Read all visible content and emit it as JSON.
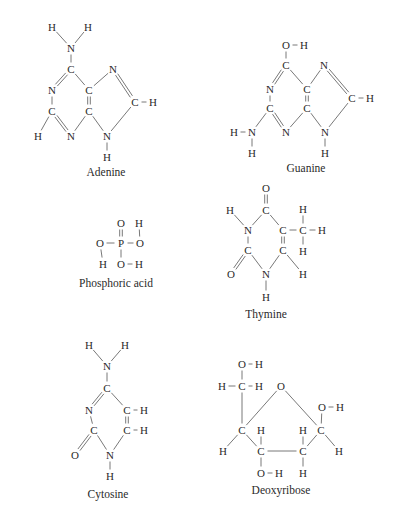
{
  "figure": {
    "type": "chemical-structures",
    "molecules": [
      {
        "id": "adenine",
        "name": "Adenine",
        "atoms": [
          {
            "t": "H",
            "x": 52,
            "y": 27
          },
          {
            "t": "H",
            "x": 88,
            "y": 27
          },
          {
            "t": "N",
            "x": 71,
            "y": 48
          },
          {
            "t": "C",
            "x": 71,
            "y": 69
          },
          {
            "t": "N",
            "x": 113,
            "y": 69
          },
          {
            "t": "N",
            "x": 52,
            "y": 90
          },
          {
            "t": "C",
            "x": 89,
            "y": 90
          },
          {
            "t": "C",
            "x": 52,
            "y": 111
          },
          {
            "t": "C",
            "x": 89,
            "y": 111
          },
          {
            "t": "C",
            "x": 135,
            "y": 102
          },
          {
            "t": "H",
            "x": 153,
            "y": 102
          },
          {
            "t": "H",
            "x": 38,
            "y": 136
          },
          {
            "t": "N",
            "x": 71,
            "y": 136
          },
          {
            "t": "N",
            "x": 107,
            "y": 136
          },
          {
            "t": "H",
            "x": 107,
            "y": 157
          }
        ],
        "bonds": [
          [
            0,
            2,
            1
          ],
          [
            1,
            2,
            1
          ],
          [
            2,
            3,
            1
          ],
          [
            3,
            5,
            2
          ],
          [
            3,
            6,
            1
          ],
          [
            6,
            4,
            1
          ],
          [
            4,
            9,
            2
          ],
          [
            9,
            10,
            1
          ],
          [
            5,
            7,
            1
          ],
          [
            7,
            11,
            1
          ],
          [
            7,
            12,
            2
          ],
          [
            12,
            8,
            1
          ],
          [
            6,
            8,
            2
          ],
          [
            8,
            13,
            1
          ],
          [
            13,
            9,
            1
          ],
          [
            13,
            14,
            1
          ]
        ],
        "label_pos": {
          "x": 106,
          "y": 172
        }
      },
      {
        "id": "guanine",
        "name": "Guanine",
        "atoms": [
          {
            "t": "O",
            "x": 286,
            "y": 45
          },
          {
            "t": "H",
            "x": 304,
            "y": 45
          },
          {
            "t": "C",
            "x": 286,
            "y": 65
          },
          {
            "t": "N",
            "x": 324,
            "y": 65
          },
          {
            "t": "N",
            "x": 270,
            "y": 89
          },
          {
            "t": "C",
            "x": 307,
            "y": 89
          },
          {
            "t": "C",
            "x": 270,
            "y": 108
          },
          {
            "t": "C",
            "x": 307,
            "y": 108
          },
          {
            "t": "C",
            "x": 352,
            "y": 98
          },
          {
            "t": "H",
            "x": 370,
            "y": 98
          },
          {
            "t": "H",
            "x": 234,
            "y": 132
          },
          {
            "t": "N",
            "x": 252,
            "y": 132
          },
          {
            "t": "N",
            "x": 286,
            "y": 132
          },
          {
            "t": "N",
            "x": 325,
            "y": 132
          },
          {
            "t": "H",
            "x": 252,
            "y": 153
          },
          {
            "t": "H",
            "x": 325,
            "y": 153
          }
        ],
        "bonds": [
          [
            0,
            1,
            1
          ],
          [
            0,
            2,
            1
          ],
          [
            2,
            4,
            2
          ],
          [
            2,
            5,
            1
          ],
          [
            5,
            3,
            1
          ],
          [
            3,
            8,
            2
          ],
          [
            8,
            9,
            1
          ],
          [
            4,
            6,
            1
          ],
          [
            6,
            11,
            1
          ],
          [
            10,
            11,
            1
          ],
          [
            11,
            14,
            1
          ],
          [
            6,
            12,
            2
          ],
          [
            12,
            7,
            1
          ],
          [
            5,
            7,
            2
          ],
          [
            7,
            13,
            1
          ],
          [
            13,
            8,
            1
          ],
          [
            13,
            15,
            1
          ]
        ],
        "label_pos": {
          "x": 306,
          "y": 168
        }
      },
      {
        "id": "phosphoric-acid",
        "name": "Phosphoric acid",
        "atoms": [
          {
            "t": "O",
            "x": 121,
            "y": 223
          },
          {
            "t": "H",
            "x": 139,
            "y": 223
          },
          {
            "t": "O",
            "x": 100,
            "y": 243
          },
          {
            "t": "P",
            "x": 121,
            "y": 243
          },
          {
            "t": "O",
            "x": 140,
            "y": 243
          },
          {
            "t": "H",
            "x": 103,
            "y": 264
          },
          {
            "t": "O",
            "x": 121,
            "y": 264
          },
          {
            "t": "H",
            "x": 139,
            "y": 264
          }
        ],
        "bonds": [
          [
            0,
            3,
            2
          ],
          [
            2,
            3,
            1
          ],
          [
            3,
            4,
            1
          ],
          [
            1,
            4,
            1
          ],
          [
            2,
            5,
            1
          ],
          [
            3,
            6,
            1
          ],
          [
            6,
            7,
            1
          ]
        ],
        "label_pos": {
          "x": 116,
          "y": 283
        }
      },
      {
        "id": "thymine",
        "name": "Thymine",
        "atoms": [
          {
            "t": "O",
            "x": 266,
            "y": 188
          },
          {
            "t": "H",
            "x": 230,
            "y": 210
          },
          {
            "t": "C",
            "x": 266,
            "y": 210
          },
          {
            "t": "H",
            "x": 303,
            "y": 209
          },
          {
            "t": "N",
            "x": 248,
            "y": 230
          },
          {
            "t": "C",
            "x": 283,
            "y": 230
          },
          {
            "t": "C",
            "x": 303,
            "y": 230
          },
          {
            "t": "H",
            "x": 322,
            "y": 230
          },
          {
            "t": "C",
            "x": 248,
            "y": 250
          },
          {
            "t": "C",
            "x": 283,
            "y": 250
          },
          {
            "t": "H",
            "x": 303,
            "y": 251
          },
          {
            "t": "O",
            "x": 231,
            "y": 274
          },
          {
            "t": "N",
            "x": 266,
            "y": 274
          },
          {
            "t": "H",
            "x": 303,
            "y": 274
          },
          {
            "t": "H",
            "x": 266,
            "y": 297
          }
        ],
        "bonds": [
          [
            0,
            2,
            2
          ],
          [
            1,
            4,
            1
          ],
          [
            2,
            4,
            1
          ],
          [
            2,
            5,
            1
          ],
          [
            5,
            6,
            1
          ],
          [
            6,
            3,
            1
          ],
          [
            6,
            7,
            1
          ],
          [
            6,
            10,
            1
          ],
          [
            4,
            8,
            1
          ],
          [
            8,
            11,
            2
          ],
          [
            8,
            12,
            1
          ],
          [
            5,
            9,
            2
          ],
          [
            9,
            12,
            1
          ],
          [
            9,
            13,
            1
          ],
          [
            12,
            14,
            1
          ]
        ],
        "label_pos": {
          "x": 266,
          "y": 314
        }
      },
      {
        "id": "cytosine",
        "name": "Cytosine",
        "atoms": [
          {
            "t": "H",
            "x": 89,
            "y": 345
          },
          {
            "t": "H",
            "x": 125,
            "y": 345
          },
          {
            "t": "N",
            "x": 107,
            "y": 366
          },
          {
            "t": "C",
            "x": 107,
            "y": 388
          },
          {
            "t": "N",
            "x": 89,
            "y": 410
          },
          {
            "t": "C",
            "x": 127,
            "y": 410
          },
          {
            "t": "H",
            "x": 144,
            "y": 410
          },
          {
            "t": "C",
            "x": 94,
            "y": 430
          },
          {
            "t": "C",
            "x": 127,
            "y": 430
          },
          {
            "t": "H",
            "x": 144,
            "y": 430
          },
          {
            "t": "O",
            "x": 75,
            "y": 455
          },
          {
            "t": "N",
            "x": 110,
            "y": 455
          },
          {
            "t": "H",
            "x": 110,
            "y": 476
          }
        ],
        "bonds": [
          [
            0,
            2,
            1
          ],
          [
            1,
            2,
            1
          ],
          [
            2,
            3,
            1
          ],
          [
            3,
            4,
            2
          ],
          [
            3,
            5,
            1
          ],
          [
            5,
            6,
            1
          ],
          [
            4,
            7,
            1
          ],
          [
            5,
            8,
            2
          ],
          [
            8,
            9,
            1
          ],
          [
            7,
            10,
            2
          ],
          [
            7,
            11,
            1
          ],
          [
            8,
            11,
            1
          ],
          [
            11,
            12,
            1
          ]
        ],
        "label_pos": {
          "x": 108,
          "y": 494
        }
      },
      {
        "id": "deoxyribose",
        "name": "Deoxyribose",
        "atoms": [
          {
            "t": "O",
            "x": 242,
            "y": 364
          },
          {
            "t": "H",
            "x": 259,
            "y": 364
          },
          {
            "t": "H",
            "x": 222,
            "y": 386
          },
          {
            "t": "C",
            "x": 242,
            "y": 386
          },
          {
            "t": "H",
            "x": 259,
            "y": 386
          },
          {
            "t": "O",
            "x": 281,
            "y": 386
          },
          {
            "t": "O",
            "x": 322,
            "y": 407
          },
          {
            "t": "H",
            "x": 340,
            "y": 407
          },
          {
            "t": "C",
            "x": 242,
            "y": 430
          },
          {
            "t": "H",
            "x": 261,
            "y": 430
          },
          {
            "t": "H",
            "x": 303,
            "y": 430
          },
          {
            "t": "C",
            "x": 321,
            "y": 430
          },
          {
            "t": "H",
            "x": 223,
            "y": 451
          },
          {
            "t": "C",
            "x": 261,
            "y": 451
          },
          {
            "t": "C",
            "x": 303,
            "y": 451
          },
          {
            "t": "H",
            "x": 339,
            "y": 451
          },
          {
            "t": "O",
            "x": 261,
            "y": 473
          },
          {
            "t": "H",
            "x": 279,
            "y": 473
          },
          {
            "t": "H",
            "x": 303,
            "y": 473
          }
        ],
        "bonds": [
          [
            0,
            1,
            1
          ],
          [
            0,
            3,
            1
          ],
          [
            2,
            3,
            1
          ],
          [
            3,
            4,
            1
          ],
          [
            3,
            8,
            1
          ],
          [
            8,
            5,
            1
          ],
          [
            5,
            11,
            1
          ],
          [
            11,
            6,
            1
          ],
          [
            6,
            7,
            1
          ],
          [
            11,
            15,
            1
          ],
          [
            11,
            14,
            1
          ],
          [
            8,
            12,
            1
          ],
          [
            8,
            13,
            1
          ],
          [
            13,
            9,
            1
          ],
          [
            13,
            14,
            1
          ],
          [
            13,
            16,
            1
          ],
          [
            16,
            17,
            1
          ],
          [
            14,
            10,
            1
          ],
          [
            14,
            18,
            1
          ]
        ],
        "label_pos": {
          "x": 281,
          "y": 490
        }
      }
    ]
  },
  "cutoff_text": {
    "top": "",
    "bottom": ""
  }
}
